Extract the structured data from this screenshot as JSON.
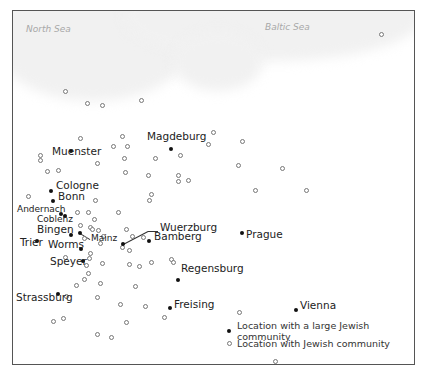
{
  "map": {
    "seas": [
      {
        "label": "North Sea",
        "x": 26,
        "y": 24
      },
      {
        "label": "Baltic Sea",
        "x": 265,
        "y": 22
      }
    ],
    "large_communities": [
      {
        "name": "Muenster",
        "x": 71,
        "y": 151,
        "lx": 52,
        "ly": 151,
        "size": "normal"
      },
      {
        "name": "Magdeburg",
        "x": 171,
        "y": 149,
        "lx": 147,
        "ly": 136,
        "size": "normal"
      },
      {
        "name": "Cologne",
        "x": 51,
        "y": 191,
        "lx": 56,
        "ly": 185,
        "size": "normal"
      },
      {
        "name": "Bonn",
        "x": 53,
        "y": 201,
        "lx": 58,
        "ly": 196,
        "size": "normal"
      },
      {
        "name": "Andernach",
        "x": 61,
        "y": 214,
        "lx": 17,
        "ly": 210,
        "size": "small"
      },
      {
        "name": "Coblenz",
        "x": 65,
        "y": 216,
        "lx": 37,
        "ly": 220,
        "size": "small"
      },
      {
        "name": "Bingen",
        "x": 71,
        "y": 235,
        "lx": 37,
        "ly": 229,
        "size": "normal"
      },
      {
        "name": "Mainz",
        "x": 80,
        "y": 233,
        "lx": 91,
        "ly": 239,
        "size": "small"
      },
      {
        "name": "Trier",
        "x": 37,
        "y": 241,
        "lx": 20,
        "ly": 242,
        "size": "normal"
      },
      {
        "name": "Worms",
        "x": 81,
        "y": 249,
        "lx": 48,
        "ly": 244,
        "size": "normal"
      },
      {
        "name": "Speyer",
        "x": 83,
        "y": 261,
        "lx": 50,
        "ly": 261,
        "size": "normal"
      },
      {
        "name": "Wuerzburg",
        "x": 123,
        "y": 244,
        "lx": 160,
        "ly": 227,
        "size": "normal"
      },
      {
        "name": "Bamberg",
        "x": 149,
        "y": 241,
        "lx": 154,
        "ly": 236,
        "size": "normal"
      },
      {
        "name": "Prague",
        "x": 242,
        "y": 233,
        "lx": 246,
        "ly": 234,
        "size": "normal"
      },
      {
        "name": "Regensburg",
        "x": 178,
        "y": 280,
        "lx": 181,
        "ly": 268,
        "size": "normal"
      },
      {
        "name": "Strassburg",
        "x": 58,
        "y": 294,
        "lx": 16,
        "ly": 297,
        "size": "normal"
      },
      {
        "name": "Freising",
        "x": 170,
        "y": 308,
        "lx": 174,
        "ly": 304,
        "size": "normal"
      },
      {
        "name": "Vienna",
        "x": 296,
        "y": 310,
        "lx": 300,
        "ly": 305,
        "size": "normal"
      }
    ],
    "communities": [
      [
        381,
        34
      ],
      [
        65,
        91
      ],
      [
        87,
        103
      ],
      [
        102,
        105
      ],
      [
        141,
        100
      ],
      [
        80,
        138
      ],
      [
        122,
        136
      ],
      [
        40,
        155
      ],
      [
        40,
        160
      ],
      [
        113,
        146
      ],
      [
        127,
        146
      ],
      [
        155,
        158
      ],
      [
        180,
        155
      ],
      [
        47,
        171
      ],
      [
        58,
        170
      ],
      [
        97,
        163
      ],
      [
        124,
        158
      ],
      [
        125,
        172
      ],
      [
        148,
        175
      ],
      [
        178,
        175
      ],
      [
        178,
        181
      ],
      [
        188,
        180
      ],
      [
        213,
        132
      ],
      [
        208,
        144
      ],
      [
        242,
        141
      ],
      [
        238,
        165
      ],
      [
        282,
        168
      ],
      [
        255,
        190
      ],
      [
        306,
        190
      ],
      [
        151,
        194
      ],
      [
        149,
        200
      ],
      [
        28,
        196
      ],
      [
        95,
        200
      ],
      [
        118,
        212
      ],
      [
        88,
        212
      ],
      [
        77,
        212
      ],
      [
        94,
        219
      ],
      [
        80,
        225
      ],
      [
        90,
        227
      ],
      [
        92,
        229
      ],
      [
        98,
        230
      ],
      [
        103,
        236
      ],
      [
        84,
        238
      ],
      [
        100,
        243
      ],
      [
        126,
        229
      ],
      [
        132,
        236
      ],
      [
        143,
        237
      ],
      [
        122,
        247
      ],
      [
        129,
        250
      ],
      [
        90,
        253
      ],
      [
        89,
        258
      ],
      [
        65,
        257
      ],
      [
        86,
        265
      ],
      [
        102,
        263
      ],
      [
        84,
        279
      ],
      [
        88,
        273
      ],
      [
        100,
        283
      ],
      [
        76,
        285
      ],
      [
        129,
        264
      ],
      [
        139,
        266
      ],
      [
        151,
        262
      ],
      [
        171,
        259
      ],
      [
        173,
        262
      ],
      [
        135,
        286
      ],
      [
        66,
        296
      ],
      [
        97,
        297
      ],
      [
        120,
        304
      ],
      [
        145,
        306
      ],
      [
        164,
        317
      ],
      [
        239,
        312
      ],
      [
        126,
        322
      ],
      [
        53,
        321
      ],
      [
        63,
        318
      ],
      [
        97,
        334
      ],
      [
        111,
        337
      ],
      [
        275,
        361
      ]
    ],
    "leaders": [
      {
        "x1": 123,
        "y1": 244,
        "x2": 148,
        "y2": 231
      },
      {
        "x1": 148,
        "y1": 231,
        "x2": 158,
        "y2": 231
      },
      {
        "x1": 80,
        "y1": 233,
        "x2": 90,
        "y2": 239
      }
    ]
  },
  "legend": {
    "large": "Location with a large Jewish community",
    "small": "Location with Jewish community"
  }
}
